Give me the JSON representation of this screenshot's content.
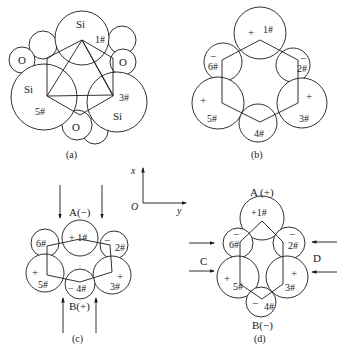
{
  "figure": {
    "panels": {
      "a": {
        "caption": "(a)",
        "atoms": [
          {
            "label": "Si",
            "tag": "1#"
          },
          {
            "label": "Si",
            "tag": "3#"
          },
          {
            "label": "Si",
            "tag": "5#"
          },
          {
            "label": "O"
          },
          {
            "label": "O"
          },
          {
            "label": "O"
          }
        ],
        "labels": {
          "si_top": "Si",
          "si_left": "Si",
          "si_right": "Si",
          "o_left": "O",
          "o_right": "O",
          "o_bottom": "O",
          "n1": "1#",
          "n3": "3#",
          "n5": "5#"
        }
      },
      "b": {
        "caption": "(b)",
        "labels": {
          "n1": "1#",
          "n2": "2#",
          "n3": "3#",
          "n4": "4#",
          "n5": "5#",
          "n6": "6#",
          "s1": "+",
          "s2": "−",
          "s3": "+",
          "s5": "+",
          "s6": "−"
        }
      },
      "c": {
        "caption": "(c)",
        "electrode_top": "A(−)",
        "electrode_bottom": "B(+)",
        "labels": {
          "n1": "+ 1#",
          "n2": "2#",
          "n3": "3#",
          "n4": "− 4#",
          "n5": "5#",
          "n6": "6#",
          "s2": "−",
          "s3": "+",
          "s5": "+"
        }
      },
      "d": {
        "caption": "(d)",
        "electrode_top": "A (+)",
        "electrode_bottom": "B(−)",
        "force_left": "C",
        "force_right": "D",
        "labels": {
          "n1": "+1#",
          "n2": "2#",
          "n3": "3#",
          "n4": "4#",
          "n5": "5#",
          "n6": "6#",
          "s2": "−",
          "s3": "+",
          "s4": "−",
          "s5": "+",
          "s6": "−"
        }
      }
    },
    "axes": {
      "x_label": "x",
      "y_label": "y",
      "origin_label": "O"
    }
  }
}
